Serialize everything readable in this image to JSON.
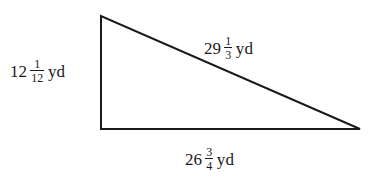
{
  "figure": {
    "type": "right-triangle-diagram",
    "unit": "yd",
    "background_color": "#ffffff",
    "stroke_color": "#1a1a1a",
    "stroke_width": 2,
    "vertices": {
      "top_left": [
        101,
        16
      ],
      "bottom_left": [
        101,
        129
      ],
      "bottom_right": [
        360,
        129
      ]
    },
    "labels": {
      "left_leg": {
        "name": "left-leg-length",
        "whole": "12",
        "numerator": "1",
        "denominator": "12",
        "unit": "yd",
        "full_text": "12 1/12 yd"
      },
      "hypotenuse": {
        "name": "hypotenuse-length",
        "whole": "29",
        "numerator": "1",
        "denominator": "3",
        "unit": "yd",
        "full_text": "29 1/3 yd"
      },
      "bottom_leg": {
        "name": "bottom-leg-length",
        "whole": "26",
        "numerator": "3",
        "denominator": "4",
        "unit": "yd",
        "full_text": "26 3/4 yd"
      }
    }
  }
}
